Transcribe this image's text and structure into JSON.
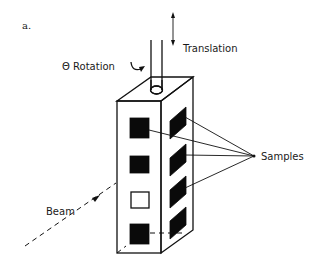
{
  "figure": {
    "panel_label": "a.",
    "labels": {
      "translation": "Translation",
      "rotation": "Θ Rotation",
      "samples": "Samples",
      "beam": "Beam"
    },
    "front_face_samples": [
      "filled",
      "filled",
      "empty",
      "filled"
    ],
    "side_face_samples": [
      "filled",
      "filled",
      "filled",
      "filled"
    ],
    "colors": {
      "ink": "#111111",
      "background": "#ffffff"
    }
  }
}
